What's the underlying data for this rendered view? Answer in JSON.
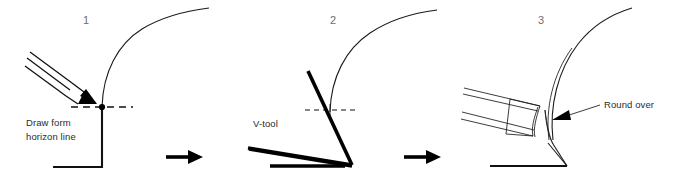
{
  "figure": {
    "background_color": "#ffffff",
    "ink_color": "#111111",
    "numeral_color": "#6e6e6e",
    "label_color": "#2b2b2b"
  },
  "panels": [
    {
      "number": "1",
      "caption_line_1": "Draw form",
      "caption_line_2": "horizon line",
      "elements": {
        "pencil": "pencil-icon",
        "horizon_line": "dashed horizon line",
        "intersection_dot": "intersection point",
        "profile_curve": "convex profile curve",
        "stock_outline": "square stock corner"
      }
    },
    {
      "number": "2",
      "caption_line_1": "V-tool",
      "caption_line_2": "",
      "elements": {
        "tool": "v-tool-icon",
        "horizon_line": "dashed horizon line",
        "profile_curve": "convex profile curve",
        "stock_outline": "stock base line"
      }
    },
    {
      "number": "3",
      "caption_line_1": "Round over",
      "caption_line_2": "",
      "elements": {
        "tool": "gouge-icon",
        "callout_arrow": "leader arrow",
        "profile_curve": "convex profile curve",
        "stock_outline": "stock base line"
      }
    }
  ],
  "transitions": [
    {
      "name": "step-1-to-2",
      "glyph": "arrow-right-icon"
    },
    {
      "name": "step-2-to-3",
      "glyph": "arrow-right-icon"
    }
  ]
}
